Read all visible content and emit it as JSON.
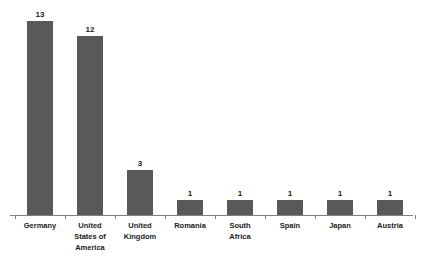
{
  "chart_data": {
    "type": "bar",
    "title": "",
    "subtitle": "",
    "xlabel": "",
    "ylabel": "",
    "categories": [
      "Germany",
      "United States of America",
      "United Kingdom",
      "Romania",
      "South Africa",
      "Spain",
      "Japan",
      "Austria"
    ],
    "category_lines": [
      [
        "Germany"
      ],
      [
        "United",
        "States of",
        "America"
      ],
      [
        "United",
        "Kingdom"
      ],
      [
        "Romania"
      ],
      [
        "South",
        "Africa"
      ],
      [
        "Spain"
      ],
      [
        "Japan"
      ],
      [
        "Austria"
      ]
    ],
    "values": [
      13,
      12,
      3,
      1,
      1,
      1,
      1,
      1
    ],
    "value_labels": [
      "13",
      "12",
      "3",
      "1",
      "1",
      "1",
      "1",
      "1"
    ],
    "ylim": [
      0,
      13
    ],
    "grid": false,
    "legend": false,
    "legend_position": "none",
    "y_axis_visible": false,
    "x_axis_visible": true,
    "bar_color": "#595959",
    "axis_color": "#808080",
    "label_color": "#1a1a1a",
    "background_color": "#ffffff"
  }
}
